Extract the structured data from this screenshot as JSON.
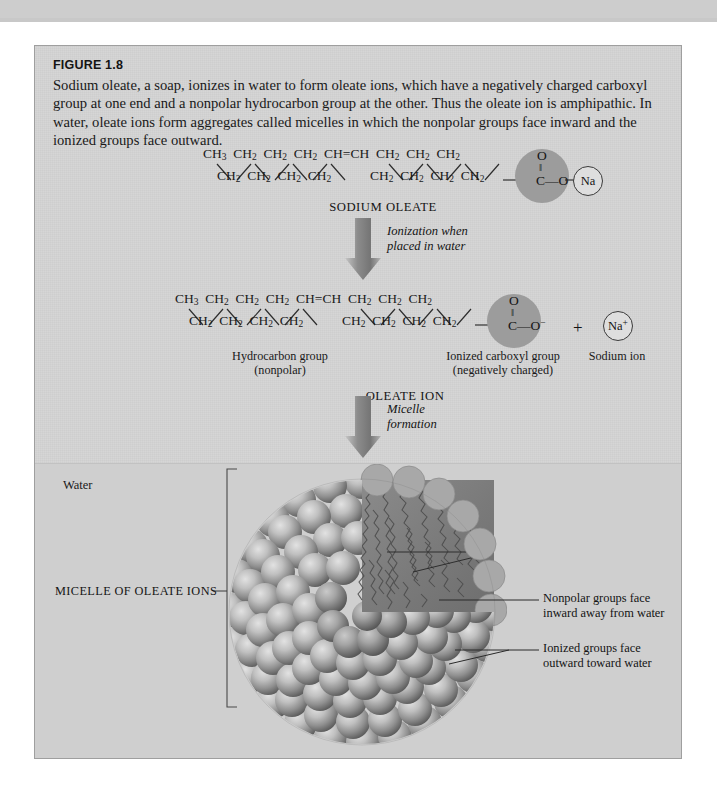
{
  "figure": {
    "number": "FIGURE 1.8",
    "caption": "Sodium oleate, a soap, ionizes in water to form oleate ions, which have a negatively charged carboxyl group at one end and a nonpolar hydrocarbon group at the other. Thus the oleate ion is amphipathic. In water, oleate ions form aggregates called micelles in which the nonpolar groups face inward and the ionized groups face outward."
  },
  "structure_top": {
    "name": "SODIUM OLEATE",
    "chain_top": [
      "CH3",
      "CH2",
      "CH2",
      "CH2",
      "CH=CH",
      "CH2",
      "CH2",
      "CH2"
    ],
    "chain_bottom": [
      "CH2",
      "CH2",
      "CH2",
      "CH2",
      "CH2",
      "CH2",
      "CH2",
      "CH2"
    ],
    "carboxyl": {
      "oxygen_double": "O",
      "double_bond": "||",
      "carbon": "C",
      "dash": "—",
      "oxygen_single": "O"
    },
    "counter_ion": "Na"
  },
  "arrow_1": {
    "line1": "Ionization when",
    "line2": "placed in water"
  },
  "structure_mid": {
    "name": "OLEATE ION",
    "chain_top": [
      "CH3",
      "CH2",
      "CH2",
      "CH2",
      "CH=CH",
      "CH2",
      "CH2",
      "CH2"
    ],
    "chain_bottom": [
      "CH2",
      "CH2",
      "CH2",
      "CH2",
      "CH2",
      "CH2",
      "CH2",
      "CH2"
    ],
    "carboxyl": {
      "oxygen_double": "O",
      "double_bond": "||",
      "carbon": "C",
      "dash": "—",
      "oxygen_single": "O",
      "charge": "−"
    },
    "counter_ion": "Na",
    "counter_ion_charge": "+",
    "plus_sign": "+",
    "label_hydrocarbon_l1": "Hydrocarbon group",
    "label_hydrocarbon_l2": "(nonpolar)",
    "label_carboxyl_l1": "Ionized carboxyl group",
    "label_carboxyl_l2": "(negatively charged)",
    "label_sodium": "Sodium ion"
  },
  "arrow_2": {
    "line1": "Micelle",
    "line2": "formation"
  },
  "micelle": {
    "water_label": "Water",
    "bracket_label": "MICELLE OF OLEATE IONS",
    "callout_1_l1": "Nonpolar groups face",
    "callout_1_l2": "inward away from water",
    "callout_2_l1": "Ionized groups face",
    "callout_2_l2": "outward toward water"
  },
  "colors": {
    "page_bg": "#ffffff",
    "figure_bg": "#d2d2d2",
    "water_bg": "#cfcfcf",
    "sphere_gray": "#9c9c9c",
    "arrow_gray": "#8e8e8e",
    "text": "#141414",
    "topbar": "#c8c8c8"
  }
}
